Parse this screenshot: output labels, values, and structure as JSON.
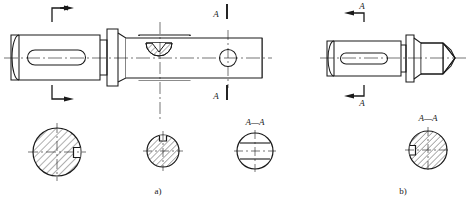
{
  "drawing": {
    "title": "Shaft orthographic views with keyway and cross-sections",
    "stroke_color": "#1a1a1a",
    "background": "#ffffff",
    "figures": [
      {
        "id": "a",
        "caption": "a)",
        "section_label": "A",
        "section_view_label": "A—A",
        "features": [
          "stepped-shaft",
          "flange-collar",
          "closed-keyway-slot",
          "woodruff-key-pocket",
          "through-hole"
        ],
        "section_circles": [
          {
            "name": "keyway-section-left",
            "notch": "right",
            "hatched": true
          },
          {
            "name": "woodruff-section-middle",
            "notch": "top",
            "hatched": true
          },
          {
            "name": "through-hole-section-AA",
            "notch": "none",
            "hatched": false,
            "label": "A—A"
          }
        ]
      },
      {
        "id": "b",
        "caption": "b)",
        "section_label": "A",
        "section_view_label": "A—A",
        "features": [
          "stepped-shaft",
          "flange-collar",
          "closed-keyway-slot",
          "conical-point-end"
        ],
        "section_circles": [
          {
            "name": "keyway-section-AA",
            "notch": "left",
            "hatched": true,
            "label": "A—A"
          }
        ]
      }
    ],
    "markers": {
      "unlabeled_arrow_top": "",
      "unlabeled_arrow_bottom": "",
      "letter_a_top": "A",
      "letter_a_bottom": "A"
    }
  }
}
